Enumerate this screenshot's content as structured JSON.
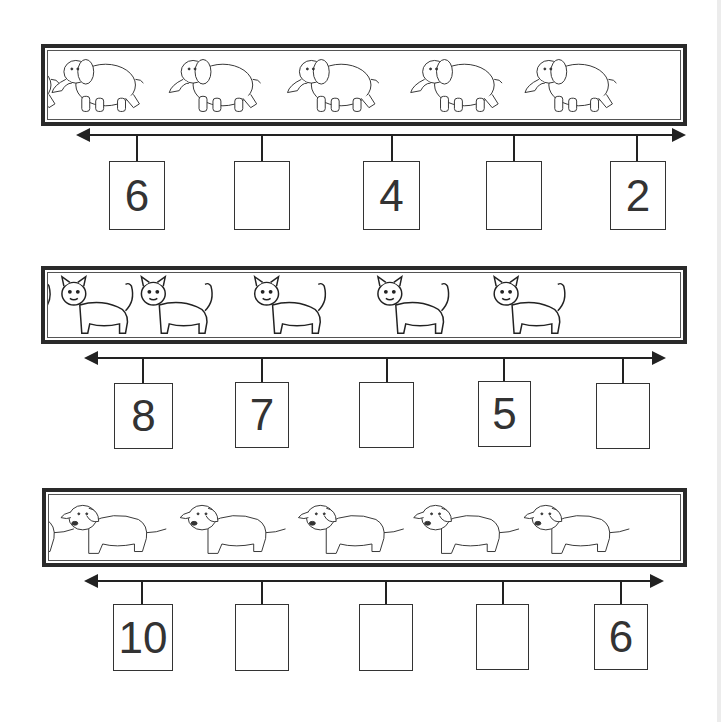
{
  "rows": [
    {
      "animal": "elephant",
      "direction": "decreasing",
      "boxes": [
        {
          "value": "6"
        },
        {
          "value": ""
        },
        {
          "value": "4"
        },
        {
          "value": ""
        },
        {
          "value": "2"
        }
      ]
    },
    {
      "animal": "cat",
      "direction": "decreasing",
      "boxes": [
        {
          "value": "8"
        },
        {
          "value": "7"
        },
        {
          "value": ""
        },
        {
          "value": "5"
        },
        {
          "value": ""
        }
      ]
    },
    {
      "animal": "dog",
      "direction": "decreasing",
      "boxes": [
        {
          "value": "10"
        },
        {
          "value": ""
        },
        {
          "value": ""
        },
        {
          "value": ""
        },
        {
          "value": "6"
        }
      ]
    }
  ],
  "colors": {
    "line": "#222222",
    "frame": "#2a2a2a",
    "text": "#333333"
  }
}
